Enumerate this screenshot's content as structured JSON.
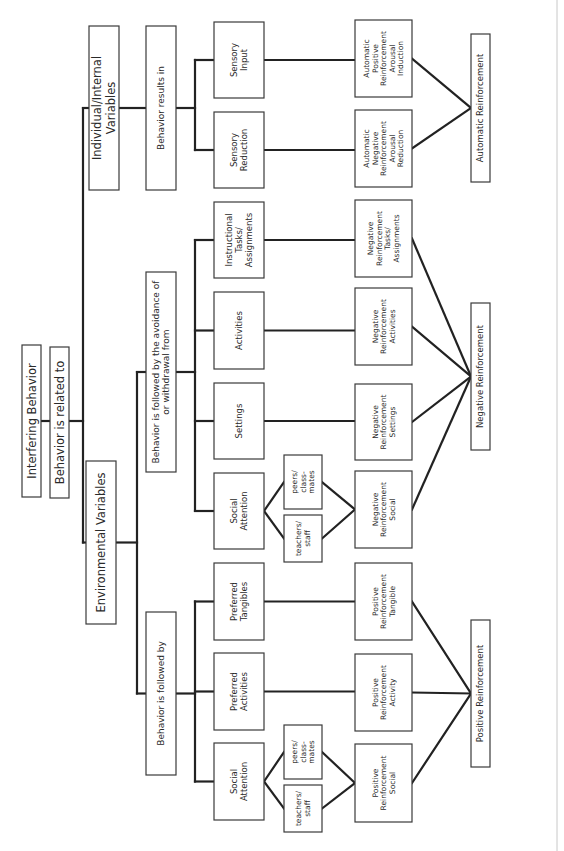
{
  "diagram": {
    "title": "Interfering Behavior",
    "root_relation": "Behavior is related to",
    "branches": {
      "individual": {
        "label": "Individual/Internal Variables",
        "relation": "Behavior results in",
        "items": [
          {
            "id": "sensory-input",
            "label": "Sensory Input",
            "outcome": "Automatic Positive Reinforcement Arousal Induction"
          },
          {
            "id": "sensory-reduction",
            "label": "Sensory Reduction",
            "outcome": "Automatic Negative Reinforcement Arousal Reduction"
          }
        ],
        "summary": "Automatic Reinforcement"
      },
      "environmental": {
        "label": "Environmental Variables",
        "avoidance": {
          "relation": "Behavior is followed by the avoidance of or withdrawal from",
          "items": [
            {
              "id": "instructional-tasks",
              "label": "Instructional Tasks/ Assignments",
              "outcome": "Negative Reinforcement Tasks/ Assignments"
            },
            {
              "id": "activities",
              "label": "Activities",
              "outcome": "Negative Reinforcement Activities"
            },
            {
              "id": "settings",
              "label": "Settings",
              "outcome": "Negative Reinforcement Settings"
            },
            {
              "id": "social-attention-neg",
              "label": "Social Attention",
              "outcome": "Negative Reinforcement Social",
              "sub": [
                "peers/ class- mates",
                "teachers/ staff"
              ]
            }
          ],
          "summary": "Negative Reinforcement"
        },
        "followed": {
          "relation": "Behavior is followed by",
          "items": [
            {
              "id": "preferred-tangibles",
              "label": "Preferred Tangibles",
              "outcome": "Positive Reinforcement Tangible"
            },
            {
              "id": "preferred-activities",
              "label": "Preferred Activities",
              "outcome": "Positive Reinforcement Activity"
            },
            {
              "id": "social-attention-pos",
              "label": "Social Attention",
              "outcome": "Positive Reinforcement Social",
              "sub": [
                "peers/ class- mates",
                "teachers/ staff"
              ]
            }
          ],
          "summary": "Positive Reinforcement"
        }
      }
    },
    "text_lines": {
      "title": [
        "Interfering Behavior"
      ],
      "root_relation": [
        "Behavior is related to"
      ],
      "individual": [
        "Individual/Internal",
        "Variables"
      ],
      "individual_relation": [
        "Behavior results in"
      ],
      "environmental": [
        "Environmental Variables"
      ],
      "avoidance_relation": [
        "Behavior is followed by the avoidance of",
        "or withdrawal from"
      ],
      "followed_relation": [
        "Behavior is followed by"
      ],
      "sensory-input": [
        "Sensory",
        "Input"
      ],
      "sensory-reduction": [
        "Sensory",
        "Reduction"
      ],
      "instructional-tasks": [
        "Instructional",
        "Tasks/",
        "Assignments"
      ],
      "activities": [
        "Activities"
      ],
      "settings": [
        "Settings"
      ],
      "social-attention-neg": [
        "Social",
        "Attention"
      ],
      "preferred-tangibles": [
        "Preferred",
        "Tangibles"
      ],
      "preferred-activities": [
        "Preferred",
        "Activities"
      ],
      "social-attention-pos": [
        "Social",
        "Attention"
      ],
      "peers-neg": [
        "peers/",
        "class-",
        "mates"
      ],
      "teachers-neg": [
        "teachers/",
        "staff"
      ],
      "peers-pos": [
        "peers/",
        "class-",
        "mates"
      ],
      "teachers-pos": [
        "teachers/",
        "staff"
      ],
      "out-auto-pos": [
        "Automatic",
        "Positive",
        "Reinforcement",
        "Arousal",
        "Induction"
      ],
      "out-auto-neg": [
        "Automatic",
        "Negative",
        "Reinforcement",
        "Arousal",
        "Reduction"
      ],
      "out-neg-tasks": [
        "Negative",
        "Reinforcement",
        "Tasks/",
        "Assignments"
      ],
      "out-neg-activities": [
        "Negative",
        "Reinforcement",
        "Activities"
      ],
      "out-neg-settings": [
        "Negative",
        "Reinforcement",
        "Settings"
      ],
      "out-neg-social": [
        "Negative",
        "Reinforcement",
        "Social"
      ],
      "out-pos-tangible": [
        "Positive",
        "Reinforcement",
        "Tangible"
      ],
      "out-pos-activity": [
        "Positive",
        "Reinforcement",
        "Activity"
      ],
      "out-pos-social": [
        "Positive",
        "Reinforcement",
        "Social"
      ],
      "sum-auto": [
        "Automatic Reinforcement"
      ],
      "sum-neg": [
        "Negative Reinforcement"
      ],
      "sum-pos": [
        "Positive Reinforcement"
      ]
    }
  }
}
